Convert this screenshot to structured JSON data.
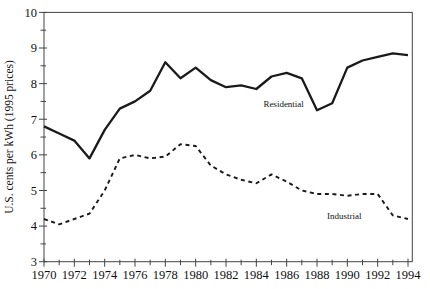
{
  "page": {
    "background": "#ffffff",
    "ink": "#1a1a1a",
    "frame_color": "#444444"
  },
  "chart_data": {
    "type": "line",
    "title": "",
    "xlabel": "",
    "ylabel": "U.S. cents per kWh (1995 prices)",
    "xlim": [
      1970,
      1994
    ],
    "ylim": [
      3,
      10
    ],
    "grid": false,
    "frame": true,
    "legend_position": "inline-annotations",
    "x_tick_labels": [
      1970,
      1972,
      1974,
      1976,
      1978,
      1980,
      1982,
      1984,
      1986,
      1988,
      1990,
      1992,
      1994
    ],
    "x_minor_tick_step": 1,
    "y_tick_labels": [
      3,
      4,
      5,
      6,
      7,
      8,
      9,
      10
    ],
    "y_minor_tick_step": 0.5,
    "x": [
      1970,
      1971,
      1972,
      1973,
      1974,
      1975,
      1976,
      1977,
      1978,
      1979,
      1980,
      1981,
      1982,
      1983,
      1984,
      1985,
      1986,
      1987,
      1988,
      1989,
      1990,
      1991,
      1992,
      1993,
      1994
    ],
    "series": [
      {
        "name": "Residential",
        "line_style": "solid",
        "values": [
          6.8,
          6.6,
          6.4,
          5.9,
          6.7,
          7.3,
          7.5,
          7.8,
          8.6,
          8.15,
          8.45,
          8.1,
          7.9,
          7.95,
          7.85,
          8.2,
          8.3,
          8.15,
          7.25,
          7.45,
          8.45,
          8.65,
          8.75,
          8.85,
          8.8
        ]
      },
      {
        "name": "Industrial",
        "line_style": "dashed",
        "values": [
          4.2,
          4.05,
          4.2,
          4.35,
          5.0,
          5.9,
          6.0,
          5.9,
          5.95,
          6.3,
          6.25,
          5.7,
          5.45,
          5.3,
          5.2,
          5.45,
          5.25,
          5.0,
          4.9,
          4.9,
          4.85,
          4.9,
          4.9,
          4.3,
          4.2
        ]
      }
    ],
    "annotations": [
      {
        "text": "Residential",
        "year": 1985.8,
        "value": 7.35
      },
      {
        "text": "Industrial",
        "year": 1989.8,
        "value": 4.2
      }
    ]
  }
}
